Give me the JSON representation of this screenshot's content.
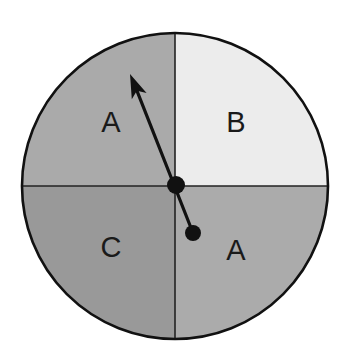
{
  "spinner": {
    "center": {
      "x": 175,
      "y": 186
    },
    "radius": 153,
    "outline_color": "#111111",
    "divider_color": "#222222",
    "sectors": [
      {
        "position": "top-left",
        "label": "A",
        "color": "#aaaaaa",
        "label_pos": {
          "x": 111,
          "y": 122
        }
      },
      {
        "position": "top-right",
        "label": "B",
        "color": "#ececec",
        "label_pos": {
          "x": 236,
          "y": 122
        }
      },
      {
        "position": "bottom-left",
        "label": "C",
        "color": "#999999",
        "label_pos": {
          "x": 111,
          "y": 247
        }
      },
      {
        "position": "bottom-right",
        "label": "A",
        "color": "#ababab",
        "label_pos": {
          "x": 236,
          "y": 250
        }
      }
    ],
    "pointer": {
      "color": "#111111",
      "tip": {
        "x": 130,
        "y": 74
      },
      "pivot": {
        "x": 176,
        "y": 185
      },
      "tail": {
        "x": 193,
        "y": 233
      },
      "pivot_radius": 9,
      "tail_radius": 8,
      "points_to_sector": "A"
    }
  }
}
